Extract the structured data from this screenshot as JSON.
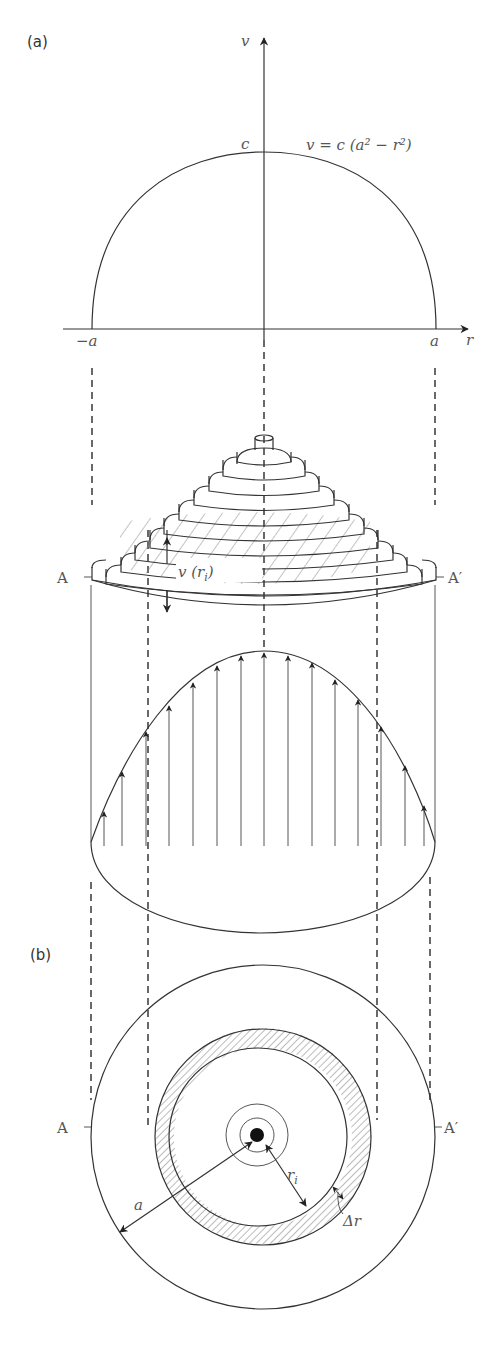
{
  "panels": {
    "a": {
      "label": "(a)"
    },
    "b": {
      "label": "(b)"
    }
  },
  "top_plot": {
    "y_axis_label": "v",
    "x_axis_label": "r",
    "peak_label": "c",
    "equation": "v = c (a² − r²)",
    "left_tick": "−a",
    "right_tick": "a"
  },
  "section": {
    "left_marker": "A",
    "right_marker": "A′",
    "shell_height_label": "v (r",
    "shell_height_sub": "i",
    "shell_height_close": ")"
  },
  "cross_section": {
    "left_marker": "A",
    "right_marker": "A′",
    "radius_label": "a",
    "inner_radius_label": "r",
    "inner_radius_sub": "i",
    "thickness_label": "Δr"
  },
  "colors": {
    "line": "#333333",
    "hatch": "#777777",
    "label": "#555555"
  }
}
